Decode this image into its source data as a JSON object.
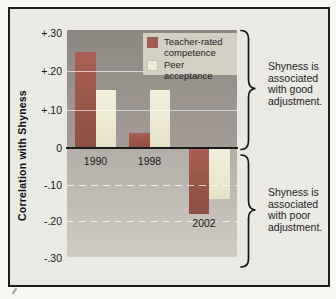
{
  "figure": {
    "y_axis_title": "Correlation with Shyness",
    "annotation_good": "Shyness is associated with good adjustment.",
    "annotation_poor": "Shyness is associated with poor adjustment."
  },
  "chart_data": {
    "type": "bar",
    "title": "",
    "categories": [
      "1990",
      "1998",
      "2002"
    ],
    "series": [
      {
        "name": "Teacher-rated competence",
        "color": "#a25b50",
        "values": [
          0.25,
          0.04,
          -0.18
        ]
      },
      {
        "name": "Peer acceptance",
        "color": "#eeebd4",
        "values": [
          0.15,
          0.15,
          -0.14
        ]
      }
    ],
    "ylabel": "Correlation with Shyness",
    "ylim": [
      -0.3,
      0.3
    ],
    "yticks": [
      0.3,
      0.2,
      0.1,
      0,
      -0.1,
      -0.2,
      -0.3
    ],
    "ytick_labels": [
      "+.30",
      "+.20",
      "+.10",
      "0",
      "-.10",
      "-.20",
      "-.30"
    ],
    "gridlines": [
      0.2,
      0.1,
      -0.1,
      -0.2
    ],
    "grid": true,
    "legend_position": "upper right"
  }
}
